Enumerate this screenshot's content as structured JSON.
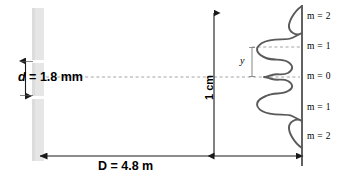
{
  "figure": {
    "type": "double-slit-interference-diagram"
  },
  "barrier": {
    "name": "slit-barrier",
    "color": "#e3e3e3",
    "slit_gap_label": "d = 1.8 mm",
    "slit_label_symbol": "d",
    "slit_label_rest": " = 1.8 mm"
  },
  "distance": {
    "name": "screen-distance",
    "label": "D = 4.8 m",
    "value": "4.8",
    "unit": "m"
  },
  "scale": {
    "name": "vertical-scale",
    "label": "1 cm",
    "value": "1",
    "unit": "cm"
  },
  "fringe_offset": {
    "name": "fringe-offset",
    "label": "y"
  },
  "screen": {
    "name": "viewing-screen",
    "color": "#444444"
  },
  "curve": {
    "name": "intensity-curve",
    "color": "#555555"
  },
  "orders": [
    {
      "label": "m = 2",
      "m": 2,
      "side": "upper",
      "y": 17
    },
    {
      "label": "m = 1",
      "m": 1,
      "side": "upper",
      "y": 47
    },
    {
      "label": "m = 0",
      "m": 0,
      "side": "center",
      "y": 77
    },
    {
      "label": "m = 1",
      "m": 1,
      "side": "lower",
      "y": 108
    },
    {
      "label": "m = 2",
      "m": 2,
      "side": "lower",
      "y": 137
    }
  ]
}
